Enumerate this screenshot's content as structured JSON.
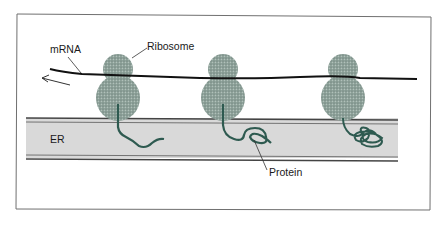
{
  "diagram": {
    "type": "biology-schematic",
    "labels": {
      "mrna": "mRNA",
      "ribosome": "Ribosome",
      "er": "ER",
      "protein": "Protein"
    },
    "ribosome_count": 3,
    "stages": [
      {
        "ribosome": 1,
        "protein_state": "short extended chain"
      },
      {
        "ribosome": 2,
        "protein_state": "longer looped chain"
      },
      {
        "ribosome": 3,
        "protein_state": "folded/coiled chain"
      }
    ],
    "arrow_direction": "left",
    "colors": {
      "ribosome": "#8fa39b",
      "protein": "#2e5a50",
      "er_fill": "#d9d9d9",
      "er_border": "#4a4a4a",
      "mrna": "#111111",
      "frame": "#666666"
    }
  }
}
